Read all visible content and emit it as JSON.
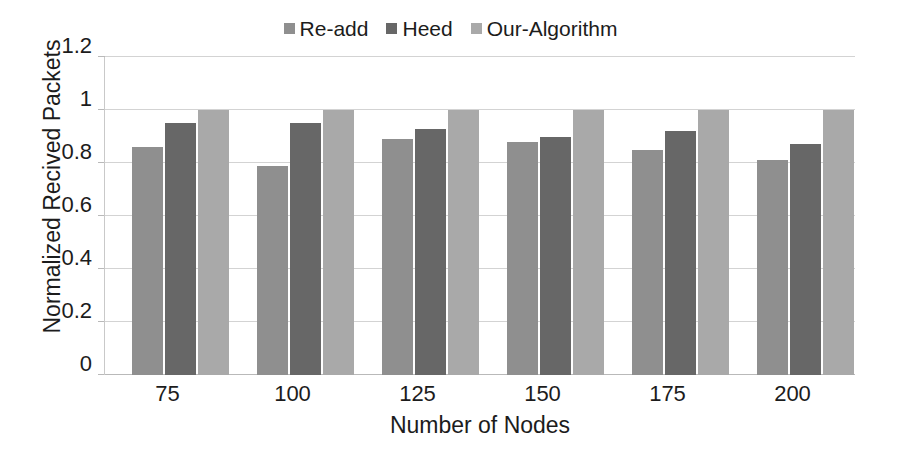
{
  "chart_data": {
    "type": "bar",
    "title": "",
    "xlabel": "Number of Nodes",
    "ylabel": "Normalized Recived Packets",
    "categories": [
      "75",
      "100",
      "125",
      "150",
      "175",
      "200"
    ],
    "series": [
      {
        "name": "Re-add",
        "color": "#8f8f8f",
        "values": [
          0.86,
          0.79,
          0.89,
          0.88,
          0.85,
          0.81
        ]
      },
      {
        "name": "Heed",
        "color": "#676767",
        "values": [
          0.95,
          0.95,
          0.93,
          0.9,
          0.92,
          0.87
        ]
      },
      {
        "name": "Our-Algorithm",
        "color": "#a9a9a9",
        "values": [
          1.0,
          1.0,
          1.0,
          1.0,
          1.0,
          1.0
        ]
      }
    ],
    "ylim": [
      0,
      1.2
    ],
    "yticks": [
      "0",
      "0.2",
      "0.4",
      "0.6",
      "0.8",
      "1",
      "1.2"
    ],
    "ytick_values": [
      0,
      0.2,
      0.4,
      0.6,
      0.8,
      1,
      1.2
    ],
    "grid": true,
    "gridline_color": "#d3d3d3",
    "legend_position": "top-center",
    "background": "#ffffff"
  }
}
